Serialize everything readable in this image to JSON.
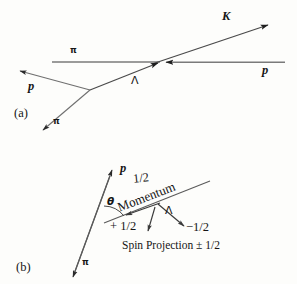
{
  "figure": {
    "background_color": "#fdfdfb",
    "ink_color": "#1a1a1a",
    "line_color": "#6e6e6e",
    "panels": [
      {
        "tag": "(a)"
      },
      {
        "tag": "(b)"
      }
    ]
  },
  "panel_a": {
    "tag": "(a)",
    "labels": {
      "beam_pi": "π",
      "target_p": "p",
      "kaon": "K",
      "lambda": "Λ",
      "decay_p": "p",
      "decay_pi": "π"
    },
    "tracks": [
      {
        "name": "beam-pi-line",
        "particle": "π",
        "from": [
          52,
          62
        ],
        "to": [
          157,
          62
        ]
      },
      {
        "name": "target-p-line",
        "particle": "p",
        "from": [
          285,
          62
        ],
        "to": [
          163,
          62
        ],
        "arrow": true
      },
      {
        "name": "kaon-track",
        "particle": "K",
        "from": [
          157,
          62
        ],
        "to": [
          271,
          24
        ],
        "arrow": true
      },
      {
        "name": "lambda-track",
        "particle": "Λ",
        "from": [
          90,
          90
        ],
        "to": [
          157,
          62
        ],
        "arrow": true
      },
      {
        "name": "decay-proton-track",
        "particle": "p",
        "from": [
          90,
          90
        ],
        "to": [
          16,
          70
        ],
        "arrow": true
      },
      {
        "name": "decay-pion-track",
        "particle": "π",
        "from": [
          90,
          90
        ],
        "to": [
          40,
          132
        ],
        "arrow": true
      }
    ]
  },
  "panel_b": {
    "tag": "(b)",
    "labels": {
      "proton": "p",
      "spin_up": "1/2",
      "theta": "θ",
      "momentum": "Momentum",
      "lambda": "Λ",
      "spin_down": "−1/2",
      "spin_plus_half": "+ 1/2",
      "caption": "Spin Projection ± 1/2",
      "pion": "π"
    },
    "tracks": [
      {
        "name": "proton-arrow",
        "particle": "p",
        "from": [
          72,
          278
        ],
        "to": [
          112,
          168
        ],
        "arrow": true
      },
      {
        "name": "pion-arrow",
        "particle": "π",
        "from": [
          112,
          168
        ],
        "to": [
          72,
          278
        ],
        "arrow": true
      },
      {
        "name": "momentum-axis",
        "particle": "Momentum",
        "from": [
          105,
          222
        ],
        "to": [
          208,
          182
        ]
      },
      {
        "name": "momentum-arrow",
        "from": [
          158,
          205
        ],
        "to": [
          124,
          216
        ],
        "arrow": true
      },
      {
        "name": "spin-down-arrow",
        "particle": "−1/2",
        "from": [
          158,
          205
        ],
        "to": [
          186,
          227
        ],
        "arrow": true
      },
      {
        "name": "spin-plus-half-arrow",
        "particle": "+ 1/2",
        "from": [
          152,
          208
        ],
        "to": [
          148,
          233
        ],
        "arrow": true
      }
    ],
    "angle_arc": {
      "name": "theta-arc",
      "vertex": [
        99,
        226
      ],
      "label": "θ"
    }
  }
}
